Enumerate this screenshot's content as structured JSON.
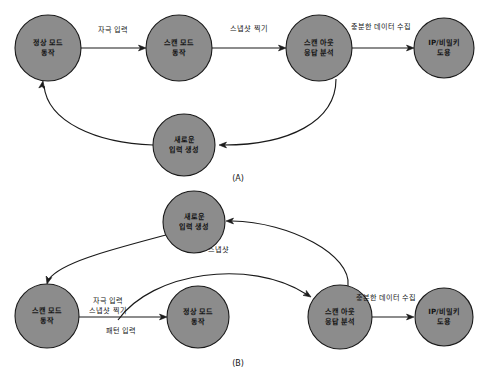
{
  "figure": {
    "background_color": "#ffffff",
    "node_fill_color": "#8c8c8c",
    "node_stroke_color": "#1a1a1a",
    "line_color": "#1a1a1a",
    "text_color": "#141414"
  },
  "panels": [
    {
      "caption": "(A)",
      "caption_x": 238,
      "caption_y": 178,
      "nodes": [
        {
          "id": "a-normal-mode",
          "name": "normal-mode-node",
          "cx": 48,
          "cy": 48,
          "r": 33,
          "lines": [
            "정상 모드",
            "동작"
          ]
        },
        {
          "id": "a-scan-mode",
          "name": "scan-mode-node",
          "cx": 179,
          "cy": 48,
          "r": 33,
          "lines": [
            "스캔 모드",
            "동작"
          ]
        },
        {
          "id": "a-scan-out",
          "name": "scan-out-analysis-node",
          "cx": 319,
          "cy": 48,
          "r": 33,
          "lines": [
            "스캔 아웃",
            "응답 분석"
          ]
        },
        {
          "id": "a-ip-theft",
          "name": "ip-key-theft-node",
          "cx": 444,
          "cy": 48,
          "r": 30,
          "lines": [
            "IP/비밀키",
            "도용"
          ]
        },
        {
          "id": "a-new-input",
          "name": "new-input-generation-node",
          "cx": 184,
          "cy": 145,
          "r": 31,
          "lines": [
            "새로운",
            "입력 생성"
          ]
        }
      ],
      "edges": [
        {
          "id": "a-e1",
          "name": "edge-normal-to-scan",
          "label": "자극 입력",
          "label_x": 113,
          "label_y": 30,
          "path": "M 81 48 L 142 48",
          "arrow_at": [
            146,
            48
          ],
          "arrow_dir": 0
        },
        {
          "id": "a-e2",
          "name": "edge-scan-to-scanout",
          "label": "스냅샷 찍기",
          "label_x": 249,
          "label_y": 29,
          "path": "M 212 48 L 282 48",
          "arrow_at": [
            286,
            48
          ],
          "arrow_dir": 0
        },
        {
          "id": "a-e3",
          "name": "edge-scanout-to-theft",
          "label": "충분한 데이터 수집",
          "label_x": 381,
          "label_y": 27,
          "path": "M 352 48 L 410 48",
          "arrow_at": [
            414,
            48
          ],
          "arrow_dir": 0
        },
        {
          "id": "a-e4",
          "name": "edge-scanout-to-newinput",
          "label": "",
          "label_x": 0,
          "label_y": 0,
          "path": "M 336 79 C 336 122 288 145 224 145",
          "arrow_at": [
            219,
            145
          ],
          "arrow_dir": 180
        },
        {
          "id": "a-e5",
          "name": "edge-newinput-to-normal",
          "label": "",
          "label_x": 0,
          "label_y": 0,
          "path": "M 153 145 C 96 143 48 122 44 86",
          "arrow_at": [
            43,
            81
          ],
          "arrow_dir": -80
        }
      ]
    },
    {
      "caption": "(B)",
      "caption_x": 238,
      "caption_y": 363,
      "nodes": [
        {
          "id": "b-new-input",
          "name": "new-input-generation-node",
          "cx": 194,
          "cy": 222,
          "r": 31,
          "lines": [
            "새로운",
            "입력 생성"
          ]
        },
        {
          "id": "b-scan-mode",
          "name": "scan-mode-node",
          "cx": 47,
          "cy": 316,
          "r": 32,
          "lines": [
            "스캔 모드",
            "동작"
          ]
        },
        {
          "id": "b-normal-mode",
          "name": "normal-mode-node",
          "cx": 198,
          "cy": 317,
          "r": 31,
          "lines": [
            "정상 모드",
            "동작"
          ]
        },
        {
          "id": "b-scan-out",
          "name": "scan-out-analysis-node",
          "cx": 340,
          "cy": 317,
          "r": 32,
          "lines": [
            "스캔 아웃",
            "응답 분석"
          ]
        },
        {
          "id": "b-ip-theft",
          "name": "ip-key-theft-node",
          "cx": 444,
          "cy": 317,
          "r": 29,
          "lines": [
            "IP/비밀키",
            "도용"
          ]
        }
      ],
      "edges": [
        {
          "id": "b-e1",
          "name": "edge-newinput-to-scanmode",
          "label": "",
          "label_x": 0,
          "label_y": 0,
          "path": "M 166 235 C 110 250 62 262 49 279",
          "arrow_at": [
            47,
            284
          ],
          "arrow_dir": 105
        },
        {
          "id": "b-e2",
          "name": "edge-scanout-to-newinput",
          "label": "",
          "label_x": 0,
          "label_y": 0,
          "path": "M 348 286 C 352 255 290 222 232 221",
          "arrow_at": [
            226,
            221
          ],
          "arrow_dir": 180
        },
        {
          "id": "b-e3",
          "name": "edge-scanmode-to-normal",
          "label": "자극 입력",
          "label_x": 108,
          "label_y": 301,
          "path": "M 79 317 L 163 317",
          "arrow_at": [
            167,
            317
          ],
          "arrow_dir": 0
        },
        {
          "id": "b-e4",
          "name": "edge-scanmode-to-scanout-curve",
          "label": "스냅샷",
          "label_x": 218,
          "label_y": 250,
          "path": "M 118 320 C 152 272 250 258 306 294",
          "arrow_at": [
            311,
            297
          ],
          "arrow_dir": 33
        }
      ],
      "extra_labels": [
        {
          "name": "edge-label-snapshot-take",
          "text": "스냅샷 찍기",
          "x": 108,
          "y": 311
        },
        {
          "name": "edge-label-pattern-input",
          "text": "패턴 입력",
          "x": 121,
          "y": 331
        },
        {
          "name": "edge-label-sufficient-data",
          "text": "충분한 데이터 수집",
          "x": 386,
          "y": 298
        }
      ],
      "plain_edges": [
        {
          "name": "edge-scanout-to-theft",
          "path": "M 372 317 L 410 317",
          "arrow_at": [
            414,
            317
          ],
          "arrow_dir": 0
        }
      ]
    }
  ]
}
